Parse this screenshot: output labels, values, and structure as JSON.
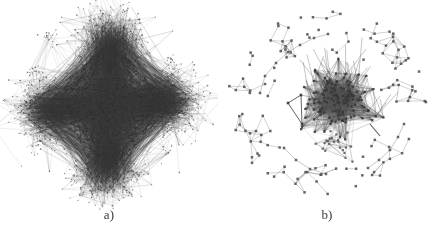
{
  "figure": {
    "title": "",
    "background_color": "#ffffff",
    "width": 436,
    "height": 248,
    "panel_count": 2
  },
  "panels": [
    {
      "id": "panel-a",
      "label": "a)",
      "graph_name": "dense-hairball-network",
      "description": "Dense force-directed network hairball with diamond outline",
      "node_color": "#4a4a4a",
      "edge_color": "#5a5a5a",
      "center": {
        "x": 109,
        "y": 108
      },
      "radius": 88
    },
    {
      "id": "panel-b",
      "label": "b)",
      "graph_name": "sparse-core-periphery-network",
      "description": "Sparse network with one dense core cluster and scattered peripheral nodes",
      "node_color": "#555555",
      "edge_color": "#6b6b6b",
      "center": {
        "x": 109,
        "y": 108
      },
      "radius": 96
    }
  ],
  "chart_data": {
    "type": "scatter",
    "title": "",
    "xlabel": "",
    "ylabel": "",
    "legend": [],
    "grid": false,
    "graphs": [
      {
        "name": "a",
        "label": "a)",
        "layout": "force-directed",
        "node_count_estimate": 2600,
        "edge_count_estimate": 9000,
        "shape": "diamond-hairball",
        "lobes": [
          "top",
          "left",
          "right",
          "bottom"
        ],
        "density": "very-high",
        "node_color": "#4a4a4a",
        "edge_color": "#5a5a5a"
      },
      {
        "name": "b",
        "label": "b)",
        "layout": "force-directed",
        "node_count_estimate": 230,
        "edge_count_estimate": 620,
        "shape": "core-periphery",
        "core": {
          "cx": 118,
          "cy": 100,
          "rx": 36,
          "ry": 33,
          "node_count_estimate": 120
        },
        "satellite_triangle": {
          "cx": 74,
          "cy": 117,
          "size": 20
        },
        "density": "low-periphery-high-core",
        "node_color": "#555555",
        "edge_color": "#6b6b6b"
      }
    ]
  }
}
